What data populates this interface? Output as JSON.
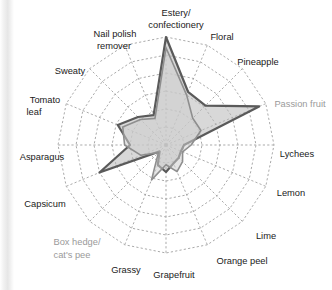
{
  "figure": {
    "background": "#ffffff",
    "gutter_visible": true
  },
  "chart_data": {
    "type": "radar",
    "title": "",
    "subtitle": "",
    "xlabel": "",
    "ylabel": "",
    "grid": true,
    "grid_rings": 6,
    "grid_style": "dashed",
    "grid_color": "#9b9b9b",
    "legend_position": "none",
    "rlim": [
      0,
      6
    ],
    "categories": [
      "Estery/\nconfectionery",
      "Floral",
      "Pineapple",
      "Passion fruit",
      "Lychees",
      "Lemon",
      "Lime",
      "Orange peel",
      "Grapefruit",
      "Grassy",
      "Box hedge/\ncat's pee",
      "Capsicum",
      "Asparagus",
      "Tomato\nleaf",
      "Sweaty",
      "Nail polish\nremover"
    ],
    "categories_flat": [
      "Estery/confectionery",
      "Floral",
      "Pineapple",
      "Passion fruit",
      "Lychees",
      "Lemon",
      "Lime",
      "Orange peel",
      "Grapefruit",
      "Grassy",
      "Box hedge/cat's pee",
      "Capsicum",
      "Asparagus",
      "Tomato leaf",
      "Sweaty",
      "Nail polish remover"
    ],
    "muted_categories": [
      "Passion fruit",
      "Box hedge/cat's pee"
    ],
    "series": [
      {
        "name": "Sample A",
        "stroke": "#5a5a5a",
        "fill": "#b8b8b8",
        "fill_opacity": 0.55,
        "stroke_width": 2.2,
        "values": [
          6.0,
          3.2,
          3.1,
          5.6,
          1.0,
          0.9,
          1.0,
          1.1,
          1.5,
          1.2,
          0.5,
          4.0,
          2.0,
          2.9,
          2.2,
          1.8
        ]
      },
      {
        "name": "Sample B",
        "stroke": "#8e8e8e",
        "fill": "#cfcfcf",
        "fill_opacity": 0.55,
        "stroke_width": 1.6,
        "values": [
          5.4,
          3.0,
          2.1,
          2.1,
          1.4,
          1.0,
          1.3,
          1.6,
          1.1,
          2.1,
          0.6,
          1.5,
          2.3,
          2.6,
          2.0,
          1.6
        ]
      }
    ],
    "label_positions": [
      {
        "label": "Estery/",
        "x": 176,
        "y": 14,
        "anchor": "middle",
        "muted": false
      },
      {
        "label": "confectionery",
        "x": 176,
        "y": 26,
        "anchor": "middle",
        "muted": false
      },
      {
        "label": "Floral",
        "x": 222,
        "y": 38,
        "anchor": "middle",
        "muted": false
      },
      {
        "label": "Pineapple",
        "x": 258,
        "y": 63,
        "anchor": "middle",
        "muted": false
      },
      {
        "label": "Passion fruit",
        "x": 300,
        "y": 105,
        "anchor": "middle",
        "muted": true
      },
      {
        "label": "Lychees",
        "x": 297,
        "y": 155,
        "anchor": "middle",
        "muted": false
      },
      {
        "label": "Lemon",
        "x": 291,
        "y": 194,
        "anchor": "middle",
        "muted": false
      },
      {
        "label": "Lime",
        "x": 266,
        "y": 237,
        "anchor": "middle",
        "muted": false
      },
      {
        "label": "Orange peel",
        "x": 242,
        "y": 262,
        "anchor": "middle",
        "muted": false
      },
      {
        "label": "Grapefruit",
        "x": 174,
        "y": 276,
        "anchor": "middle",
        "muted": false
      },
      {
        "label": "Grassy",
        "x": 126,
        "y": 271,
        "anchor": "middle",
        "muted": false
      },
      {
        "label": "Box hedge/",
        "x": 77,
        "y": 243,
        "anchor": "middle",
        "muted": true
      },
      {
        "label": "cat's pee",
        "x": 72,
        "y": 256,
        "anchor": "middle",
        "muted": true
      },
      {
        "label": "Capsicum",
        "x": 45,
        "y": 205,
        "anchor": "middle",
        "muted": false
      },
      {
        "label": "Asparagus",
        "x": 42,
        "y": 158,
        "anchor": "middle",
        "muted": false
      },
      {
        "label": "Tomato",
        "x": 45,
        "y": 101,
        "anchor": "middle",
        "muted": false
      },
      {
        "label": "leaf",
        "x": 34,
        "y": 113,
        "anchor": "middle",
        "muted": false
      },
      {
        "label": "Sweaty",
        "x": 70,
        "y": 72,
        "anchor": "middle",
        "muted": false
      },
      {
        "label": "Nail polish",
        "x": 115,
        "y": 35,
        "anchor": "middle",
        "muted": false
      },
      {
        "label": "remover",
        "x": 114,
        "y": 47,
        "anchor": "middle",
        "muted": false
      }
    ]
  }
}
